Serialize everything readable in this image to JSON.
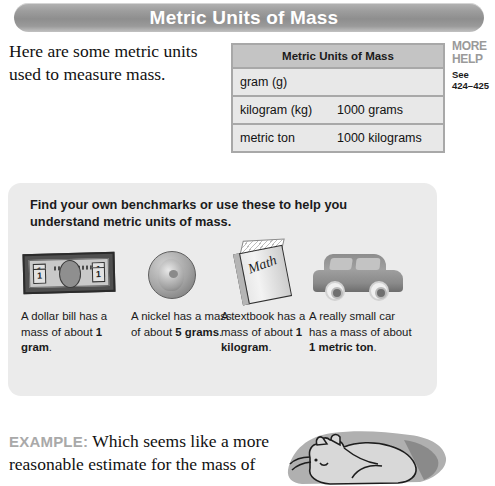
{
  "page": {
    "title": "Metric Units of Mass",
    "intro": "Here are some metric units used to measure mass."
  },
  "units_table": {
    "header": "Metric Units of Mass",
    "rows": [
      {
        "unit": "gram (g)",
        "equivalent": ""
      },
      {
        "unit": "kilogram (kg)",
        "equivalent": "1000 grams"
      },
      {
        "unit": "metric ton",
        "equivalent": "1000 kilograms"
      }
    ]
  },
  "more_help": {
    "line1": "MORE",
    "line2": "HELP",
    "see_label": "See",
    "pages": "424–425"
  },
  "benchmarks": {
    "heading": "Find your own benchmarks or use these to help you understand metric units of mass.",
    "items": [
      {
        "icon": "dollar-bill-icon",
        "bill_value": "1",
        "caption_prefix": "A dollar bill has a mass of about ",
        "caption_value": "1 gram",
        "caption_suffix": "."
      },
      {
        "icon": "nickel-coin-icon",
        "caption_prefix": "A nickel has a mass of about ",
        "caption_value": "5 grams",
        "caption_suffix": "."
      },
      {
        "icon": "textbook-icon",
        "book_title": "Math",
        "caption_prefix": "A textbook has a mass of about ",
        "caption_value": "1 kilogram",
        "caption_suffix": "."
      },
      {
        "icon": "car-icon",
        "caption_prefix": "A really small car has a mass of about ",
        "caption_value": "1 metric ton",
        "caption_suffix": "."
      }
    ]
  },
  "example": {
    "label": "EXAMPLE:",
    "text": "Which seems like a more reasonable estimate for the mass of"
  },
  "colors": {
    "title_bar": "#9d9d9d",
    "table_header": "#c4c4c4",
    "table_cell": "#e8e8e8",
    "panel_bg": "#ebebeb",
    "more_help_gray": "#9a9a9a",
    "example_label_gray": "#a9a9a9"
  }
}
